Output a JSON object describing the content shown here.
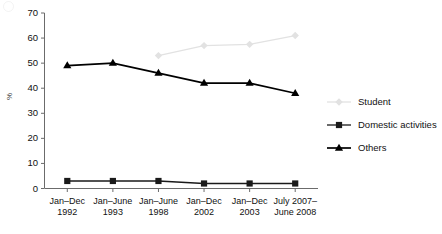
{
  "chart_data": {
    "type": "line",
    "title": "",
    "xlabel": "",
    "ylabel": "%",
    "ylim": [
      0,
      70
    ],
    "yticks": [
      0,
      10,
      20,
      30,
      40,
      50,
      60,
      70
    ],
    "grid": false,
    "legend_position": "right",
    "categories": [
      "Jan–Dec 1992",
      "Jan–June 1993",
      "Jan–June 1998",
      "Jan–Dec 2002",
      "Jan–Dec 2003",
      "July 2007–June 2008"
    ],
    "category_lines": [
      {
        "line1": "Jan–Dec",
        "line2": "1992"
      },
      {
        "line1": "Jan–June",
        "line2": "1993"
      },
      {
        "line1": "Jan–June",
        "line2": "1998"
      },
      {
        "line1": "Jan–Dec",
        "line2": "2002"
      },
      {
        "line1": "Jan–Dec",
        "line2": "2003"
      },
      {
        "line1": "July 2007–",
        "line2": "June 2008"
      }
    ],
    "series": [
      {
        "name": "Student",
        "marker": "diamond",
        "color": "#e2e2e2",
        "values": [
          null,
          null,
          53,
          57,
          57.5,
          61
        ]
      },
      {
        "name": "Domestic activities",
        "marker": "square",
        "color": "#1a1a1a",
        "values": [
          3,
          3,
          3,
          2,
          2,
          2
        ]
      },
      {
        "name": "Others",
        "marker": "triangle",
        "color": "#000000",
        "values": [
          49,
          50,
          46,
          42,
          42,
          38
        ]
      }
    ]
  },
  "axes": {
    "y_label": "%",
    "y_tick_labels": [
      "0",
      "10",
      "20",
      "30",
      "40",
      "50",
      "60",
      "70"
    ]
  },
  "legend": {
    "items": [
      {
        "label": "Student",
        "marker": "diamond-marker-icon",
        "color": "#e2e2e2"
      },
      {
        "label": "Domestic activities",
        "marker": "square-marker-icon",
        "color": "#1a1a1a"
      },
      {
        "label": "Others",
        "marker": "triangle-marker-icon",
        "color": "#000000"
      }
    ]
  }
}
